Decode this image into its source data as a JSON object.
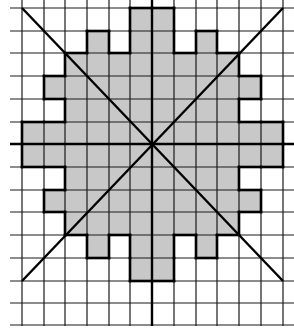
{
  "figure": {
    "grid": {
      "columns": 12,
      "rows": 14,
      "x_lines": [
        22,
        44,
        65,
        87,
        109,
        130,
        152,
        174,
        196,
        217,
        239,
        261,
        283
      ],
      "y_lines": [
        8,
        31,
        53,
        76,
        99,
        122,
        144,
        167,
        190,
        212,
        235,
        258,
        281,
        303,
        325
      ],
      "line_color": "#1a1a1a",
      "h_line_extent": [
        10,
        294
      ],
      "v_line_extent": [
        0,
        326
      ]
    },
    "shading": {
      "fill_color": "#c8c8c8",
      "outline_color": "#000000",
      "rows": [
        {
          "row": 0,
          "cells": [
            [
              5,
              6
            ]
          ]
        },
        {
          "row": 1,
          "cells": [
            [
              3,
              3
            ],
            [
              5,
              6
            ],
            [
              8,
              8
            ]
          ]
        },
        {
          "row": 2,
          "cells": [
            [
              2,
              9
            ]
          ]
        },
        {
          "row": 3,
          "cells": [
            [
              1,
              10
            ]
          ]
        },
        {
          "row": 4,
          "cells": [
            [
              2,
              9
            ]
          ]
        },
        {
          "row": 5,
          "cells": [
            [
              0,
              11
            ]
          ]
        },
        {
          "row": 6,
          "cells": [
            [
              0,
              11
            ]
          ]
        },
        {
          "row": 7,
          "cells": [
            [
              2,
              9
            ]
          ]
        },
        {
          "row": 8,
          "cells": [
            [
              1,
              10
            ]
          ]
        },
        {
          "row": 9,
          "cells": [
            [
              2,
              9
            ]
          ]
        },
        {
          "row": 10,
          "cells": [
            [
              3,
              3
            ],
            [
              5,
              6
            ],
            [
              8,
              8
            ]
          ]
        },
        {
          "row": 11,
          "cells": [
            [
              5,
              6
            ]
          ]
        }
      ]
    },
    "axes": {
      "center": [
        152,
        144
      ],
      "horizontal": {
        "from": [
          10,
          144
        ],
        "to": [
          294,
          144
        ]
      },
      "vertical": {
        "from": [
          152,
          0
        ],
        "to": [
          152,
          326
        ]
      },
      "diagonal_1": {
        "from": [
          22,
          8
        ],
        "to": [
          283,
          281
        ]
      },
      "diagonal_2": {
        "from": [
          283,
          8
        ],
        "to": [
          22,
          281
        ]
      }
    }
  }
}
